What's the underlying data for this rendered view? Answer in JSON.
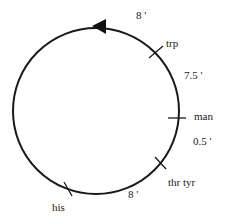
{
  "diagram": {
    "type": "circular genetic map",
    "direction": "counterclockwise arrow at top",
    "circle": {
      "cx": 96,
      "cy": 111,
      "r": 83,
      "stroke": "#1a1a1a"
    },
    "markers": [
      {
        "label": "trp",
        "angle_deg": -52
      },
      {
        "label": "man",
        "angle_deg": 4
      },
      {
        "label": "thr tyr",
        "angle_deg": 45
      },
      {
        "label": "his",
        "angle_deg": 122
      }
    ],
    "distances": [
      {
        "label": "8 '",
        "between": [
          "his",
          "trp (via top)"
        ]
      },
      {
        "label": "7.5 '",
        "between": [
          "trp",
          "man"
        ]
      },
      {
        "label": "0.5 '",
        "between": [
          "man",
          "thr tyr"
        ]
      },
      {
        "label": "8 '",
        "between": [
          "thr tyr",
          "his"
        ]
      }
    ]
  },
  "labels": {
    "trp": "trp",
    "man": "man",
    "thr_tyr": "thr tyr",
    "his": "his",
    "d_top": "8 '",
    "d_trp_man": "7.5 '",
    "d_man_thr": "0.5 '",
    "d_bottom": "8 '"
  }
}
